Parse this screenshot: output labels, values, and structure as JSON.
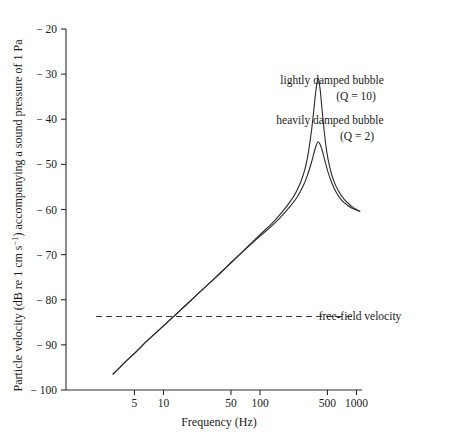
{
  "chart_data": {
    "type": "line",
    "title": "",
    "xlabel": "Frequency (Hz)",
    "ylabel": "Particle velocity (dB re 1 cm s−1) accompanying a sound pressure of 1 Pa",
    "ylabel_parts": {
      "lead": "Particle velocity (dB re 1 cm s",
      "exponent": "−1",
      "tail": ") accompanying a sound pressure of 1 Pa"
    },
    "xscale": "log",
    "xlim": [
      2,
      1300
    ],
    "ylim": [
      -100,
      -20
    ],
    "grid": false,
    "legend_position": "inline-annotation",
    "xticks": [
      {
        "value": 5,
        "label": "5"
      },
      {
        "value": 10,
        "label": "10"
      },
      {
        "value": 50,
        "label": "50"
      },
      {
        "value": 100,
        "label": "100"
      },
      {
        "value": 500,
        "label": "500"
      },
      {
        "value": 1000,
        "label": "1000"
      }
    ],
    "yticks": [
      {
        "value": -20,
        "label": "− 20"
      },
      {
        "value": -30,
        "label": "− 30"
      },
      {
        "value": -40,
        "label": "− 40"
      },
      {
        "value": -50,
        "label": "− 50"
      },
      {
        "value": -60,
        "label": "− 60"
      },
      {
        "value": -70,
        "label": "− 70"
      },
      {
        "value": -80,
        "label": "− 80"
      },
      {
        "value": -90,
        "label": "− 90"
      },
      {
        "value": -100,
        "label": "− 100"
      }
    ],
    "series": [
      {
        "name": "lightly damped bubble (Q = 10)",
        "q": 10,
        "resonance_hz": 400,
        "peak_db": -31,
        "points": [
          [
            3.0,
            -96.5
          ],
          [
            4.0,
            -93.8
          ],
          [
            5.0,
            -91.9
          ],
          [
            7.0,
            -88.8
          ],
          [
            10.0,
            -85.8
          ],
          [
            15.0,
            -82.3
          ],
          [
            20.0,
            -79.8
          ],
          [
            30.0,
            -76.3
          ],
          [
            40.0,
            -73.8
          ],
          [
            50.0,
            -71.8
          ],
          [
            70.0,
            -68.8
          ],
          [
            100.0,
            -65.6
          ],
          [
            130.0,
            -63.3
          ],
          [
            160.0,
            -61.2
          ],
          [
            200.0,
            -58.6
          ],
          [
            240.0,
            -55.9
          ],
          [
            280.0,
            -52.4
          ],
          [
            310.0,
            -48.6
          ],
          [
            340.0,
            -42.9
          ],
          [
            360.0,
            -38.2
          ],
          [
            380.0,
            -33.6
          ],
          [
            400.0,
            -31.0
          ],
          [
            420.0,
            -33.4
          ],
          [
            440.0,
            -38.0
          ],
          [
            465.0,
            -43.0
          ],
          [
            490.0,
            -47.0
          ],
          [
            530.0,
            -50.8
          ],
          [
            580.0,
            -53.6
          ],
          [
            650.0,
            -55.9
          ],
          [
            750.0,
            -57.8
          ],
          [
            880.0,
            -59.2
          ],
          [
            1000.0,
            -60.0
          ],
          [
            1080.0,
            -60.4
          ]
        ]
      },
      {
        "name": "heavily damped bubble (Q = 2)",
        "q": 2,
        "resonance_hz": 400,
        "peak_db": -45,
        "points": [
          [
            3.0,
            -96.5
          ],
          [
            4.0,
            -93.8
          ],
          [
            5.0,
            -91.9
          ],
          [
            7.0,
            -88.8
          ],
          [
            10.0,
            -85.8
          ],
          [
            15.0,
            -82.3
          ],
          [
            20.0,
            -79.8
          ],
          [
            30.0,
            -76.3
          ],
          [
            40.0,
            -73.8
          ],
          [
            50.0,
            -71.8
          ],
          [
            70.0,
            -68.9
          ],
          [
            100.0,
            -65.9
          ],
          [
            130.0,
            -63.8
          ],
          [
            160.0,
            -61.9
          ],
          [
            200.0,
            -59.6
          ],
          [
            240.0,
            -57.4
          ],
          [
            280.0,
            -54.8
          ],
          [
            310.0,
            -52.4
          ],
          [
            340.0,
            -49.7
          ],
          [
            365.0,
            -47.2
          ],
          [
            385.0,
            -45.6
          ],
          [
            400.0,
            -45.0
          ],
          [
            420.0,
            -45.6
          ],
          [
            445.0,
            -47.2
          ],
          [
            470.0,
            -49.2
          ],
          [
            510.0,
            -51.9
          ],
          [
            560.0,
            -54.3
          ],
          [
            620.0,
            -56.3
          ],
          [
            700.0,
            -57.9
          ],
          [
            800.0,
            -59.0
          ],
          [
            900.0,
            -59.7
          ],
          [
            1000.0,
            -60.1
          ],
          [
            1080.0,
            -60.4
          ]
        ]
      }
    ],
    "reference_lines": [
      {
        "name": "free-field velocity",
        "label": "free-field velocity",
        "value_db": -83.7,
        "style": "dashed",
        "x_from": 2,
        "x_to": 900
      }
    ],
    "annotations": [
      {
        "name": "lightly-damped-label-line1",
        "text": "lightly damped bubble",
        "x": 332,
        "y": 84
      },
      {
        "name": "lightly-damped-label-line2",
        "text": "(Q = 10)",
        "x": 356,
        "y": 100
      },
      {
        "name": "heavily-damped-label-line1",
        "text": "heavily damped bubble",
        "x": 330,
        "y": 124
      },
      {
        "name": "heavily-damped-label-line2",
        "text": "(Q = 2)",
        "x": 357,
        "y": 140
      },
      {
        "name": "free-field-velocity-label",
        "text": "free-field velocity",
        "x": 360,
        "y": 320
      }
    ],
    "colors": {
      "curve": "#2b2b2b",
      "axis": "#2b2b2b",
      "reference_line": "#3a3a3a",
      "background": "#ffffff",
      "text": "#1a1a1a"
    }
  },
  "layout": {
    "plot_left_px": 66,
    "plot_right_px": 362,
    "plot_top_px": 29,
    "plot_bottom_px": 390,
    "x_anchor_value": 100,
    "x_anchor_px": 260,
    "decade_px": 96.5
  }
}
